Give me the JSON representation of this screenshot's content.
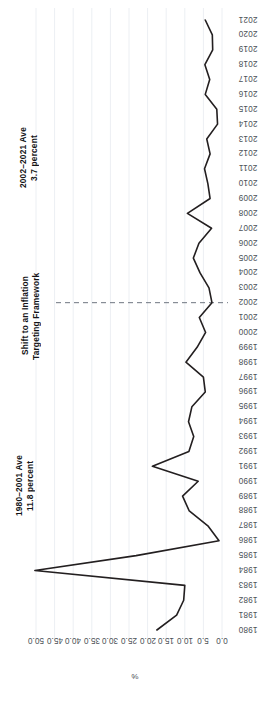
{
  "chart_data": {
    "type": "line",
    "title": "",
    "subtitle": "",
    "orientation": "rotated-90",
    "xlabel": "%",
    "ylabel": "",
    "grid": true,
    "legend": "none",
    "xlim": [
      0.0,
      50.0
    ],
    "x_axis_reversed": true,
    "xticks": [
      "50.0",
      "45.0",
      "40.0",
      "35.0",
      "30.0",
      "25.0",
      "20.0",
      "15.0",
      "10.0",
      "5.0",
      "0.0"
    ],
    "xtick_values": [
      50.0,
      45.0,
      40.0,
      35.0,
      30.0,
      25.0,
      20.0,
      15.0,
      10.0,
      5.0,
      0.0
    ],
    "categories": [
      "1980",
      "1981",
      "1982",
      "1983",
      "1984",
      "1985",
      "1986",
      "1987",
      "1988",
      "1989",
      "1990",
      "1991",
      "1992",
      "1993",
      "1994",
      "1995",
      "1996",
      "1997",
      "1998",
      "1999",
      "2000",
      "2001",
      "2002",
      "2003",
      "2004",
      "2005",
      "2006",
      "2007",
      "2008",
      "2009",
      "2010",
      "2011",
      "2012",
      "2013",
      "2014",
      "2015",
      "2016",
      "2017",
      "2018",
      "2019",
      "2020",
      "2021"
    ],
    "values": [
      17.5,
      12.2,
      10.3,
      10.0,
      50.3,
      23.1,
      0.8,
      3.8,
      8.8,
      10.6,
      6.4,
      18.7,
      8.9,
      7.6,
      9.0,
      8.1,
      4.5,
      5.0,
      9.7,
      6.7,
      4.4,
      6.1,
      2.7,
      3.5,
      5.9,
      7.7,
      6.2,
      2.8,
      9.3,
      3.2,
      3.8,
      4.7,
      3.2,
      4.1,
      1.2,
      1.4,
      4.5,
      3.3,
      4.6,
      2.5,
      2.6,
      4.5
    ],
    "reference_line": {
      "at_category": "2002",
      "style": "dashed",
      "label": "Shift to an Inflation\nTargeting Framework"
    },
    "annotations": [
      {
        "id": "ave-1980-2001",
        "text": "1980–2001 Ave\n11.8 percent",
        "value": 11.8,
        "period": "1980–2001"
      },
      {
        "id": "shift-note",
        "text": "Shift to an Inflation\nTargeting Framework"
      },
      {
        "id": "ave-2002-2021",
        "text": "2002–2021 Ave\n3.7 percent",
        "value": 3.7,
        "period": "2002–2021"
      }
    ],
    "colors": {
      "line": "#231f20",
      "grid": "#eceff3",
      "reference": "#6f7680",
      "tick_text": "#4c5257",
      "annotation_text": "#141417",
      "background": "#ffffff"
    }
  }
}
